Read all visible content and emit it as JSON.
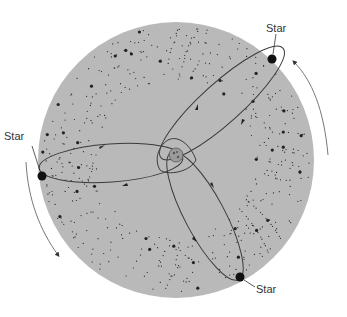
{
  "diagram": {
    "background_disc_color": "#b9b9b9",
    "line_color": "#444444",
    "star_color": "#111111",
    "labels": [
      {
        "id": "star-top-right",
        "text": "Star",
        "x": 266,
        "y": 22
      },
      {
        "id": "star-left",
        "text": "Star",
        "x": 4,
        "y": 130
      },
      {
        "id": "star-bottom-right",
        "text": "Star",
        "x": 256,
        "y": 283
      }
    ],
    "stars": [
      {
        "id": "star-top-right",
        "cx": 272,
        "cy": 59
      },
      {
        "id": "star-left",
        "cx": 42,
        "cy": 176
      },
      {
        "id": "star-bottom-right",
        "cx": 240,
        "cy": 277
      }
    ],
    "central_object": {
      "cx": 176,
      "cy": 155,
      "r": 6
    },
    "rotation_arrows": [
      {
        "id": "arrow-right",
        "direction": "counterclockwise-up"
      },
      {
        "id": "arrow-left",
        "direction": "counterclockwise-down"
      }
    ]
  }
}
